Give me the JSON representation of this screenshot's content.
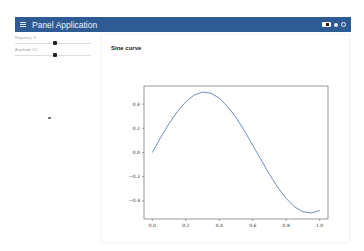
{
  "header": {
    "title": "Panel Application",
    "bg_color": "#2e5b93"
  },
  "sidebar": {
    "sliders": [
      {
        "label": "Frequency: 3",
        "position_pct": 52
      },
      {
        "label": "Amplitude: 0.5",
        "position_pct": 50
      }
    ]
  },
  "card": {
    "title": "Sine curve"
  },
  "chart_data": {
    "type": "line",
    "title": "",
    "xlabel": "",
    "ylabel": "",
    "xlim": [
      -0.05,
      1.05
    ],
    "ylim": [
      -0.55,
      0.55
    ],
    "grid": false,
    "xticks": [
      "0.0",
      "0.2",
      "0.4",
      "0.6",
      "0.8",
      "1.0"
    ],
    "yticks": [
      "-0.4",
      "-0.2",
      "0.0",
      "0.2",
      "0.4"
    ],
    "series": [
      {
        "name": "sine",
        "color": "#4a72a8",
        "x": [
          0.0,
          0.05,
          0.1,
          0.15,
          0.2,
          0.25,
          0.3,
          0.35,
          0.4,
          0.45,
          0.5,
          0.55,
          0.6,
          0.65,
          0.7,
          0.75,
          0.8,
          0.85,
          0.9,
          0.95,
          1.0
        ],
        "y": [
          0.0,
          0.125,
          0.24,
          0.34,
          0.42,
          0.475,
          0.5,
          0.49,
          0.45,
          0.38,
          0.29,
          0.18,
          0.06,
          -0.06,
          -0.18,
          -0.29,
          -0.38,
          -0.45,
          -0.49,
          -0.5,
          -0.48
        ]
      }
    ]
  }
}
